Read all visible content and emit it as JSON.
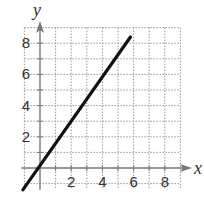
{
  "chart_data": {
    "type": "line",
    "title": "",
    "xlabel": "x",
    "ylabel": "y",
    "xlim": [
      -1,
      9
    ],
    "ylim": [
      -1.4,
      9
    ],
    "x_ticks": [
      "2",
      "4",
      "6",
      "8"
    ],
    "y_ticks": [
      "2",
      "4",
      "6",
      "8"
    ],
    "grid": true,
    "grid_style": "dotted",
    "legend": null,
    "series": [
      {
        "name": "line",
        "x": [
          -1.1,
          5.8
        ],
        "y": [
          -1.4,
          8.4
        ],
        "color": "#111111"
      }
    ]
  },
  "colors": {
    "line": "#111111",
    "axis": "#777777",
    "grid": "#999999",
    "text": "#333333"
  }
}
